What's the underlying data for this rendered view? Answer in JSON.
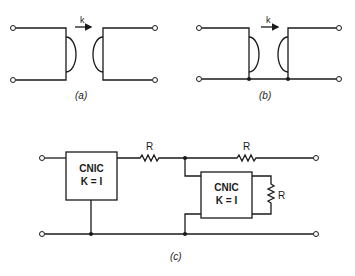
{
  "figure": {
    "panel_a": {
      "caption": "(a)",
      "coupling_label": "k"
    },
    "panel_b": {
      "caption": "(b)",
      "coupling_label": "k"
    },
    "panel_c": {
      "caption": "(c)",
      "cnic_1": {
        "line1": "CNIC",
        "line2": "K = I"
      },
      "cnic_2": {
        "line1": "CNIC",
        "line2": "K = I"
      },
      "resistor_series_1": "R",
      "resistor_series_2": "R",
      "resistor_shunt": "R"
    }
  },
  "colors": {
    "ink": "#1a1a1a",
    "background": "#ffffff"
  }
}
